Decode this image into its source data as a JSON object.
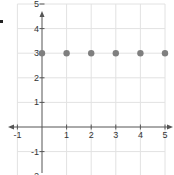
{
  "chart_data": {
    "type": "scatter",
    "title": "",
    "xlabel": "",
    "ylabel": "",
    "xlim": [
      -1,
      5
    ],
    "ylim": [
      -2,
      5
    ],
    "grid": true,
    "x_ticks": [
      "-1",
      "1",
      "2",
      "3",
      "4",
      "5"
    ],
    "y_ticks": [
      "5",
      "4",
      "3",
      "2",
      "1",
      "-1",
      "-2"
    ],
    "series": [
      {
        "name": "points",
        "x": [
          0,
          1,
          2,
          3,
          4,
          5
        ],
        "y": [
          3,
          3,
          3,
          3,
          3,
          3
        ]
      }
    ],
    "colors": {
      "grid": "#e2e2e2",
      "axis": "#555555",
      "point": "#7f7f7f",
      "text": "#333333"
    }
  }
}
